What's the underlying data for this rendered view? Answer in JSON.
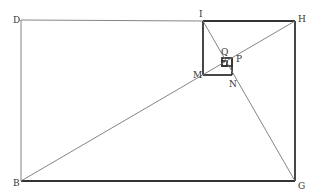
{
  "diagram": {
    "title": "",
    "colors": {
      "thin": "#777777",
      "thick": "#333333",
      "label": "#333333"
    },
    "points": {
      "D": [
        21,
        20
      ],
      "I": [
        203,
        21
      ],
      "H": [
        295,
        21
      ],
      "B": [
        21,
        181
      ],
      "G": [
        295,
        181
      ],
      "M": [
        203,
        75
      ],
      "N": [
        232,
        75
      ],
      "P": [
        232,
        58
      ],
      "Q": [
        222,
        58
      ]
    },
    "labels": [
      {
        "text": "D",
        "x": 13,
        "y": 22
      },
      {
        "text": "I",
        "x": 199,
        "y": 17
      },
      {
        "text": "H",
        "x": 298,
        "y": 21
      },
      {
        "text": "B",
        "x": 13,
        "y": 186
      },
      {
        "text": "G",
        "x": 298,
        "y": 188
      },
      {
        "text": "M",
        "x": 193,
        "y": 77
      },
      {
        "text": "N",
        "x": 230,
        "y": 86
      },
      {
        "text": "P",
        "x": 236,
        "y": 61
      },
      {
        "text": "Q",
        "x": 221,
        "y": 54
      }
    ]
  }
}
